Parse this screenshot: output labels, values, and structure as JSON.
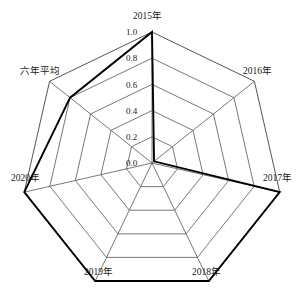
{
  "chart_data": {
    "type": "radar",
    "title": "",
    "subtitle": "",
    "xlabel": "",
    "ylabel": "",
    "categories": [
      "2015年",
      "2016年",
      "2017年",
      "2018年",
      "2019年",
      "2020年",
      "六年平均"
    ],
    "series": [
      {
        "name": "",
        "values": [
          1.0,
          0.02,
          1.0,
          1.0,
          1.0,
          1.0,
          0.8
        ]
      }
    ],
    "tick_labels": [
      "0.0",
      "0.2",
      "0.4",
      "0.6",
      "0.8",
      "1.0"
    ],
    "tick_values": [
      0.0,
      0.2,
      0.4,
      0.6,
      0.8,
      1.0
    ],
    "rlim": [
      0.0,
      1.0
    ],
    "rings": 5,
    "grid": true,
    "legend": "none",
    "colors": {
      "grid_line": "#555555",
      "series_line": "#000000",
      "background": "#ffffff",
      "text": "#1a1a1a"
    },
    "geometry": {
      "center_x": 152,
      "center_y": 163,
      "radius": 131,
      "start_angle_deg": -90
    }
  },
  "axis_labels": [
    {
      "text": "2015年",
      "x": 133,
      "y": 12
    },
    {
      "text": "2016年",
      "x": 243,
      "y": 67
    },
    {
      "text": "2017年",
      "x": 263,
      "y": 174
    },
    {
      "text": "2018年",
      "x": 192,
      "y": 268
    },
    {
      "text": "2019年",
      "x": 84,
      "y": 268
    },
    {
      "text": "2020年",
      "x": 11,
      "y": 174
    },
    {
      "text": "六年平均",
      "x": 20,
      "y": 67
    }
  ],
  "tick_labels_positioned": [
    {
      "text": "1.0",
      "x": 126,
      "y": 28
    },
    {
      "text": "0.8",
      "x": 126,
      "y": 54
    },
    {
      "text": "0.6",
      "x": 126,
      "y": 81
    },
    {
      "text": "0.4",
      "x": 126,
      "y": 107
    },
    {
      "text": "0.2",
      "x": 126,
      "y": 133
    },
    {
      "text": "0.0",
      "x": 126,
      "y": 159
    }
  ]
}
